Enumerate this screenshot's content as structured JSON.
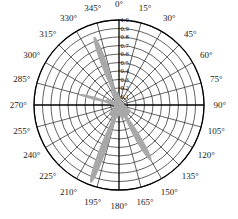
{
  "figure": {
    "name": "polar-antenna-pattern",
    "background_color": "#ffffff",
    "axis_color": "#000000",
    "grid_color": "#3a3a3a",
    "lobe_color": "#a8a8a8"
  },
  "chart_data": {
    "type": "line",
    "subtype": "polar",
    "title": "",
    "xlabel": "",
    "ylabel": "",
    "grid": true,
    "legend": null,
    "angular_axis": {
      "unit": "degrees",
      "start": 0,
      "direction": "clockwise",
      "zero_location": "top",
      "tick_step": 15,
      "tick_labels": [
        "0°",
        "15°",
        "30°",
        "45°",
        "60°",
        "75°",
        "90°",
        "105°",
        "120°",
        "135°",
        "150°",
        "165°",
        "180°",
        "195°",
        "210°",
        "225°",
        "240°",
        "255°",
        "270°",
        "285°",
        "300°",
        "315°",
        "330°",
        "345°"
      ],
      "tick_values": [
        0,
        15,
        30,
        45,
        60,
        75,
        90,
        105,
        120,
        135,
        150,
        165,
        180,
        195,
        210,
        225,
        240,
        255,
        270,
        285,
        300,
        315,
        330,
        345
      ]
    },
    "radial_axis": {
      "rlim": [
        0,
        1.0
      ],
      "tick_step": 0.1,
      "tick_values": [
        1.0,
        0.9,
        0.8,
        0.7,
        0.6,
        0.5,
        0.4,
        0.3,
        0.2,
        0.1
      ],
      "tick_labels": [
        "1.0",
        "0.9",
        "0.8",
        "0.7",
        "0.6",
        "0.5",
        "0.4",
        "0.3",
        "0.2",
        "0.1"
      ],
      "label_angle_deg": 0
    },
    "series": [
      {
        "name": "magnitude",
        "style": "filled-lobes",
        "color": "#a8a8a8",
        "angles_deg": [
          0,
          5,
          10,
          15,
          20,
          25,
          30,
          35,
          40,
          45,
          50,
          55,
          60,
          65,
          70,
          75,
          80,
          85,
          90,
          95,
          100,
          105,
          110,
          115,
          120,
          125,
          130,
          135,
          140,
          145,
          150,
          155,
          160,
          165,
          170,
          175,
          180,
          185,
          190,
          195,
          200,
          205,
          210,
          215,
          220,
          225,
          230,
          235,
          240,
          245,
          250,
          255,
          260,
          265,
          270,
          275,
          280,
          285,
          290,
          295,
          300,
          305,
          310,
          315,
          320,
          325,
          330,
          335,
          340,
          345,
          350,
          355
        ],
        "values": [
          0.12,
          0.1,
          0.09,
          0.08,
          0.07,
          0.06,
          0.06,
          0.05,
          0.05,
          0.05,
          0.05,
          0.05,
          0.06,
          0.06,
          0.06,
          0.06,
          0.06,
          0.06,
          0.07,
          0.08,
          0.09,
          0.1,
          0.12,
          0.16,
          0.22,
          0.34,
          0.5,
          0.62,
          0.7,
          0.74,
          0.76,
          0.72,
          0.58,
          0.38,
          0.22,
          0.14,
          0.12,
          0.16,
          0.28,
          0.52,
          0.78,
          0.94,
          0.98,
          0.86,
          0.6,
          0.34,
          0.18,
          0.11,
          0.08,
          0.07,
          0.06,
          0.06,
          0.06,
          0.06,
          0.07,
          0.12,
          0.26,
          0.44,
          0.5,
          0.42,
          0.24,
          0.12,
          0.08,
          0.07,
          0.09,
          0.16,
          0.32,
          0.58,
          0.78,
          0.86,
          0.72,
          0.36
        ]
      }
    ],
    "major_lobes": [
      {
        "center_angle_deg": 200,
        "peak_value": 0.98,
        "half_width_deg": 7
      },
      {
        "center_angle_deg": 340,
        "peak_value": 0.86,
        "half_width_deg": 7
      },
      {
        "center_angle_deg": 150,
        "peak_value": 0.76,
        "half_width_deg": 8
      },
      {
        "center_angle_deg": 285,
        "peak_value": 0.5,
        "half_width_deg": 6
      }
    ]
  }
}
